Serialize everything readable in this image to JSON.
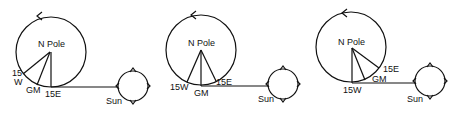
{
  "panels": [
    {
      "pole_label": "N Pole",
      "labels": {
        "w": "15\nW",
        "gm": "GM",
        "e": "15E"
      },
      "sun_label": "Sun"
    },
    {
      "pole_label": "N Pole",
      "labels": {
        "w": "15W",
        "gm": "GM",
        "e": "15E"
      },
      "sun_label": "Sun"
    },
    {
      "pole_label": "N Pole",
      "labels": {
        "w": "15W",
        "gm": "GM",
        "e": "15E"
      },
      "sun_label": "Sun"
    }
  ],
  "p1": {
    "pole": "N Pole",
    "w_top": "15",
    "w_bot": "W",
    "gm": "GM",
    "e": "15E",
    "sun": "Sun"
  },
  "p2": {
    "pole": "N Pole",
    "w": "15W",
    "gm": "GM",
    "e": "15E",
    "sun": "Sun"
  },
  "p3": {
    "pole": "N Pole",
    "w": "15W",
    "gm": "GM",
    "e": "15E",
    "sun": "Sun"
  },
  "colors": {
    "stroke": "#111111",
    "background": "#ffffff"
  }
}
